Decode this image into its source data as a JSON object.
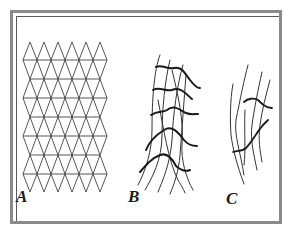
{
  "figure": {
    "panels": [
      {
        "id": "A",
        "label": "A",
        "description": "regular triangular lattice"
      },
      {
        "id": "B",
        "label": "B",
        "description": "distorted deformed lattice with wavy thick horizontal lines"
      },
      {
        "id": "C",
        "label": "C",
        "description": "small sparse distorted lattice fragment"
      }
    ]
  },
  "colors": {
    "frame": "#8a8a8a",
    "line": "#333333",
    "thick_line": "#1a1a1a",
    "background": "#ffffff"
  }
}
